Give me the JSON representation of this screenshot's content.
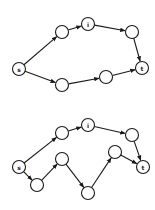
{
  "colors": {
    "stroke": "#1a1a1a",
    "fill": "#ffffff"
  },
  "node_radius": 6.5,
  "graphs": [
    {
      "name": "top-graph",
      "nodes": [
        {
          "id": "s",
          "label": "s",
          "x": 19,
          "y": 69
        },
        {
          "id": "a",
          "label": "",
          "x": 62,
          "y": 32
        },
        {
          "id": "i",
          "label": "i",
          "x": 88,
          "y": 24
        },
        {
          "id": "b",
          "label": "",
          "x": 132,
          "y": 32
        },
        {
          "id": "t",
          "label": "t",
          "x": 142,
          "y": 68
        },
        {
          "id": "c",
          "label": "",
          "x": 62,
          "y": 85
        },
        {
          "id": "d",
          "label": "",
          "x": 106,
          "y": 77
        }
      ],
      "edges": [
        [
          "s",
          "a"
        ],
        [
          "a",
          "i"
        ],
        [
          "i",
          "b"
        ],
        [
          "b",
          "t"
        ],
        [
          "s",
          "c"
        ],
        [
          "c",
          "d"
        ],
        [
          "d",
          "t"
        ]
      ]
    },
    {
      "name": "bottom-graph",
      "nodes": [
        {
          "id": "s",
          "label": "s",
          "x": 19,
          "y": 167
        },
        {
          "id": "a",
          "label": "",
          "x": 62,
          "y": 133
        },
        {
          "id": "i",
          "label": "i",
          "x": 88,
          "y": 125
        },
        {
          "id": "b",
          "label": "",
          "x": 132,
          "y": 135
        },
        {
          "id": "t",
          "label": "t",
          "x": 143,
          "y": 167
        },
        {
          "id": "e",
          "label": "",
          "x": 37,
          "y": 185
        },
        {
          "id": "f",
          "label": "",
          "x": 62,
          "y": 159
        },
        {
          "id": "g",
          "label": "",
          "x": 88,
          "y": 193
        },
        {
          "id": "h",
          "label": "",
          "x": 115,
          "y": 152
        }
      ],
      "edges": [
        [
          "s",
          "a"
        ],
        [
          "a",
          "i"
        ],
        [
          "i",
          "b"
        ],
        [
          "b",
          "t"
        ],
        [
          "s",
          "e"
        ],
        [
          "e",
          "f"
        ],
        [
          "f",
          "g"
        ],
        [
          "g",
          "h"
        ],
        [
          "h",
          "t"
        ]
      ]
    }
  ]
}
